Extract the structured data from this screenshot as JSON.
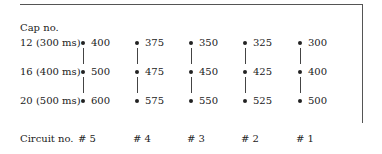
{
  "heading": "Cap no.",
  "rows": [
    {
      "label": "12 (300 ms)"
    },
    {
      "label": "16 (400 ms)"
    },
    {
      "label": "20 (500 ms)"
    }
  ],
  "columns": [
    {
      "circuit": "# 5",
      "values": [
        "400",
        "500",
        "600"
      ]
    },
    {
      "circuit": "# 4",
      "values": [
        "375",
        "475",
        "575"
      ]
    },
    {
      "circuit": "# 3",
      "values": [
        "350",
        "450",
        "550"
      ]
    },
    {
      "circuit": "# 2",
      "values": [
        "325",
        "425",
        "525"
      ]
    },
    {
      "circuit": "# 1",
      "values": [
        "300",
        "400",
        "500"
      ]
    }
  ],
  "footer_label": "Circuit no."
}
